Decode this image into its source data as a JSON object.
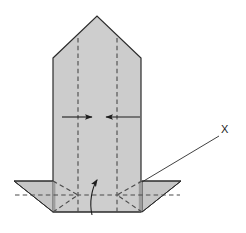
{
  "figure": {
    "kind": "origami-folding-diagram",
    "background_color": "#ffffff",
    "paper_fill": "#c9c9c9",
    "paper_fill_light": "#d2d2d2",
    "paper_fill_shadow": "#a8a8a8",
    "paper_fill_dark_edge": "#8f8f8f",
    "outline_color": "#2b2b2b",
    "crease_color": "#4a4a4a",
    "arrow_color": "#1d1d1d",
    "label_color": "#1d1d1d"
  },
  "labels": {
    "x_label": "X"
  },
  "annotations": {
    "leader_line": {
      "name": "leader-line-to-x",
      "from_x": 142,
      "from_y": 182,
      "to_x": 219,
      "to_y": 136
    },
    "arrows": [
      {
        "name": "fold-arrow-left-inward",
        "type": "straight",
        "direction": "right",
        "start_x": 62,
        "start_y": 117,
        "end_x": 94,
        "end_y": 117
      },
      {
        "name": "fold-arrow-right-inward",
        "type": "straight",
        "direction": "left",
        "start_x": 140,
        "start_y": 117,
        "end_x": 104,
        "end_y": 117
      },
      {
        "name": "fold-arrow-bottom-up",
        "type": "curved",
        "direction": "up",
        "start_x": 92,
        "start_y": 215,
        "end_x": 98,
        "end_y": 177
      }
    ]
  },
  "shapes": {
    "body": {
      "name": "main-paper-body",
      "description": "tall pentagon with peaked top and rectangular lower section",
      "points": "53,58 97,16 141,58 141,212 53,212"
    },
    "left_flap": {
      "name": "left-bottom-flap",
      "points": "14,181 53,181 53,212"
    },
    "right_flap": {
      "name": "right-bottom-flap",
      "points": "181,181 142,181 142,212"
    }
  },
  "creases": [
    {
      "name": "crease-vertical-left",
      "x1": 78,
      "y1": 38,
      "x2": 78,
      "y2": 212
    },
    {
      "name": "crease-vertical-right",
      "x1": 117,
      "y1": 38,
      "x2": 117,
      "y2": 212
    },
    {
      "name": "crease-horizontal-base",
      "x1": 14,
      "y1": 195,
      "x2": 181,
      "y2": 195
    },
    {
      "name": "crease-diag-left-up",
      "x1": 53,
      "y1": 181,
      "x2": 78,
      "y2": 195
    },
    {
      "name": "crease-diag-left-down",
      "x1": 53,
      "y1": 212,
      "x2": 78,
      "y2": 195
    },
    {
      "name": "crease-diag-right-up",
      "x1": 142,
      "y1": 181,
      "x2": 117,
      "y2": 195
    },
    {
      "name": "crease-diag-right-down",
      "x1": 142,
      "y1": 212,
      "x2": 117,
      "y2": 195
    }
  ]
}
